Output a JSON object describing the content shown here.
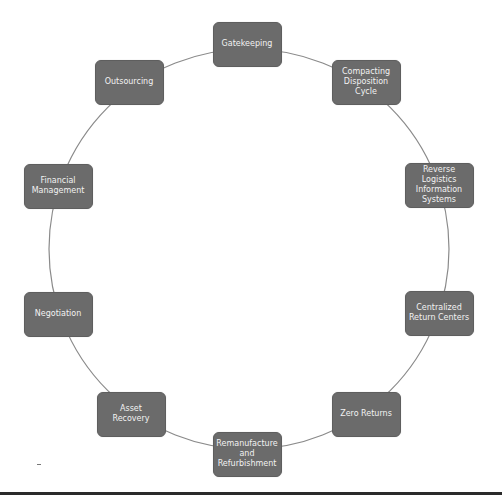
{
  "diagram": {
    "type": "cycle",
    "colors": {
      "node_fill": "#6b6b6b",
      "node_text": "#f2f2f2",
      "connector": "#8a8a8a",
      "bottom_rule": "#2a2a2a"
    },
    "nodes": [
      {
        "label": "Gatekeeping"
      },
      {
        "label": "Compacting\nDisposition\nCycle"
      },
      {
        "label": "Reverse\nLogistics\nInformation\nSystems"
      },
      {
        "label": "Centralized\nReturn Centers"
      },
      {
        "label": "Zero Returns"
      },
      {
        "label": "Remanufacture\nand\nRefurbishment"
      },
      {
        "label": "Asset Recovery"
      },
      {
        "label": "Negotiation"
      },
      {
        "label": "Financial\nManagement"
      },
      {
        "label": "Outsourcing"
      }
    ]
  }
}
